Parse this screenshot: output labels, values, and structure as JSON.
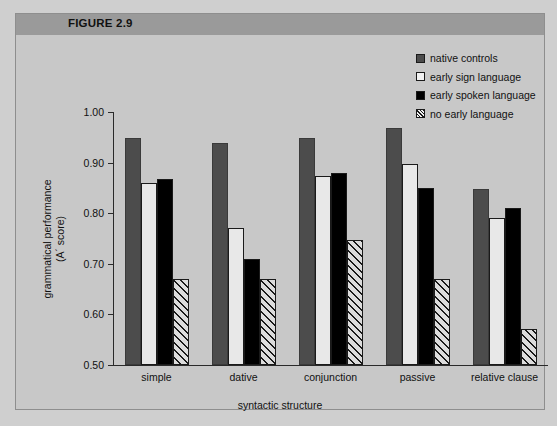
{
  "figure": {
    "header_label": "FIGURE 2.9",
    "header_color": "#9a9a9a",
    "panel_color": "#c8c8c8"
  },
  "legend": {
    "items": [
      {
        "label": "native controls",
        "swatch": "gray",
        "color": "#4c4c4c"
      },
      {
        "label": "early sign language",
        "swatch": "white",
        "color": "#f2f2f2"
      },
      {
        "label": "early spoken language",
        "swatch": "black",
        "color": "#000000"
      },
      {
        "label": "no early language",
        "swatch": "hatch",
        "color": "#f2f2f2"
      }
    ]
  },
  "chart_data": {
    "type": "bar",
    "title": "FIGURE 2.9",
    "xlabel": "syntactic structure",
    "ylabel": "grammatical performance (A' score)",
    "ylabel_line1": "grammatical performance",
    "ylabel_line2": "(A´ score)",
    "ylim": [
      0.5,
      1.0
    ],
    "ytick_labels": [
      "1.00",
      "0.90",
      "0.80",
      "0.70",
      "0.60",
      "0.50"
    ],
    "yticks": [
      1.0,
      0.9,
      0.8,
      0.7,
      0.6,
      0.5
    ],
    "grid": false,
    "legend_position": "top-right",
    "categories": [
      "simple",
      "dative",
      "conjunction",
      "passive",
      "relative clause"
    ],
    "series": [
      {
        "name": "native controls",
        "values": [
          0.948,
          0.938,
          0.948,
          0.968,
          0.847
        ]
      },
      {
        "name": "early sign language",
        "values": [
          0.859,
          0.77,
          0.873,
          0.898,
          0.79
        ]
      },
      {
        "name": "early spoken language",
        "values": [
          0.867,
          0.71,
          0.879,
          0.85,
          0.81
        ]
      },
      {
        "name": "no early language",
        "values": [
          0.67,
          0.67,
          0.748,
          0.67,
          0.572
        ]
      }
    ]
  }
}
